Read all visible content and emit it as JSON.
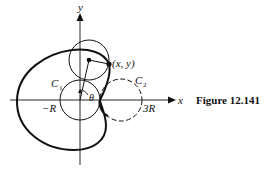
{
  "figure": {
    "caption": "Figure 12.141",
    "labels": {
      "x_axis": "x",
      "y_axis": "y",
      "point": "(x, y)",
      "c1": "C",
      "c1_sub": "1",
      "c2": "C",
      "c2_sub": "2",
      "theta": "θ",
      "neg_r": "−R",
      "three_r": "3R"
    },
    "colors": {
      "ink": "#111111",
      "background": "#ffffff"
    },
    "elements": {
      "fixed_circle": "C1 centered at origin, radius R (solid)",
      "reference_circle": "C2 centered at (2R, 0), radius R (dashed)",
      "rolling_circle": "circle of radius R tangent to C1 (solid)",
      "curve": "cardioid traced by point (x, y) (bold)"
    }
  }
}
